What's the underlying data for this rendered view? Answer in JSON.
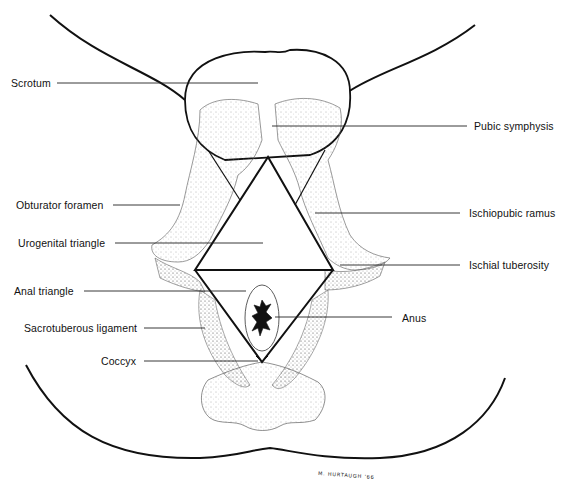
{
  "figure": {
    "signature": "M. HURTAUGH '66",
    "colors": {
      "line": "#111111",
      "stipple": "#555555",
      "background": "#ffffff"
    }
  },
  "labels_left": [
    {
      "id": "scrotum",
      "text": "Scrotum"
    },
    {
      "id": "obturator-foramen",
      "text": "Obturator foramen"
    },
    {
      "id": "urogenital-triangle",
      "text": "Urogenital triangle"
    },
    {
      "id": "anal-triangle",
      "text": "Anal triangle"
    },
    {
      "id": "sacrotuberous-ligament",
      "text": "Sacrotuberous ligament"
    },
    {
      "id": "coccyx",
      "text": "Coccyx"
    }
  ],
  "labels_right": [
    {
      "id": "pubic-symphysis",
      "text": "Pubic symphysis"
    },
    {
      "id": "ischiopubic-ramus",
      "text": "Ischiopubic ramus"
    },
    {
      "id": "ischial-tuberosity",
      "text": "Ischial tuberosity"
    },
    {
      "id": "anus",
      "text": "Anus"
    }
  ]
}
